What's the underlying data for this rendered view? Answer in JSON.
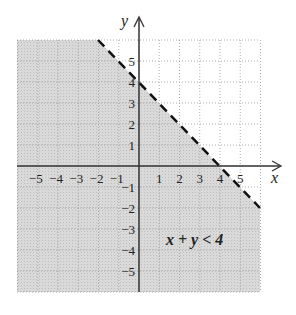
{
  "chart_data": {
    "type": "inequality-graph",
    "title": "",
    "xlabel": "x",
    "ylabel": "y",
    "xlim": [
      -6,
      6
    ],
    "ylim": [
      -6,
      6
    ],
    "grid": true,
    "x_ticks": [
      "−5",
      "−4",
      "−3",
      "−2",
      "−1",
      "1",
      "2",
      "3",
      "4",
      "5"
    ],
    "y_ticks": [
      "5",
      "4",
      "3",
      "2",
      "1",
      "−1",
      "−2",
      "−3",
      "−4",
      "−5"
    ],
    "boundary": {
      "equation": "x + y = 4",
      "style": "dashed",
      "points": [
        [
          -2,
          6
        ],
        [
          6,
          -2
        ]
      ]
    },
    "shaded_region": "below boundary",
    "annotation": "x + y < 4",
    "colors": {
      "shade": "#d6d6d6",
      "grid": "#9a9a9a",
      "axis": "#333333",
      "boundary": "#111111"
    }
  }
}
